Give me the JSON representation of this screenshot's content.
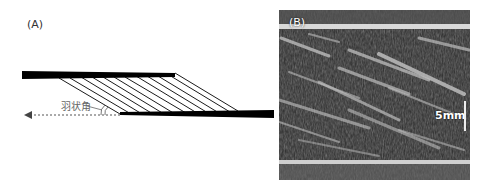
{
  "figure": {
    "panel_a": {
      "label": "(A)",
      "angle_label": "羽状角",
      "description": "Schematic of pennate muscle: two aponeurosis bars with oblique fascicles; dashed arrow indicates line of action"
    },
    "panel_b": {
      "label": "(B)",
      "scale_label": "5mm",
      "description": "Ultrasound image of pennate muscle showing oblique fascicles between aponeuroses"
    }
  },
  "colors": {
    "line": "#000000",
    "text": "#333333",
    "angle_text": "#666666",
    "ultrasound_bg": "#2a2a2a"
  }
}
